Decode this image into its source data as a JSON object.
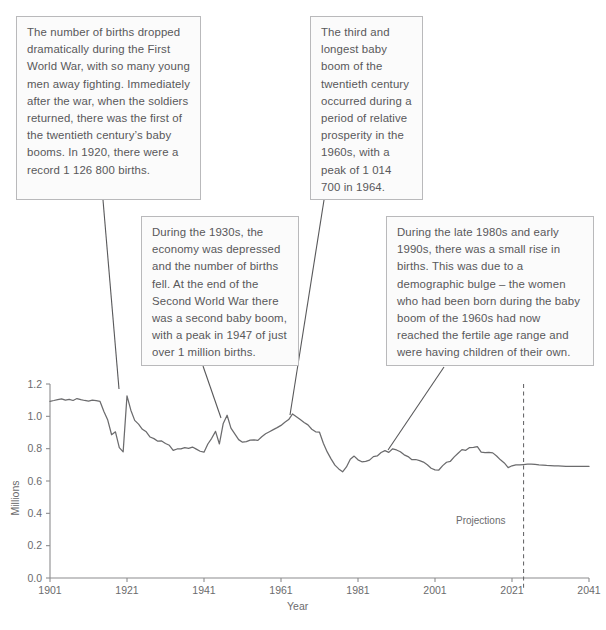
{
  "notes": [
    {
      "id": "note-wwi-birth-drop",
      "text": "The number of births dropped dramatically during the First World War, with so many young men away fighting. Immediately after the war, when the soldiers returned, there was the first of the twentieth century’s baby booms. In 1920, there were a record 1 126 800 births."
    },
    {
      "id": "note-1930s-depression",
      "text": "During the 1930s, the economy was depressed and the number of births fell. At the end of the Second World War there was a second baby boom, with a peak in 1947 of just over 1 million births."
    },
    {
      "id": "note-1960s-baby-boom",
      "text": "The third and longest baby boom of the twentieth century occurred during a period of relative prosperity in the 1960s, with a peak of 1 014 700 in 1964."
    },
    {
      "id": "note-1980s-1990s-rise",
      "text": "During the late 1980s and early 1990s, there was a small rise in births. This was due to a demographic bulge – the women who had been born during the baby boom of the 1960s had now reached the fertile age range and were having children of their own."
    }
  ],
  "chart_data": {
    "type": "line",
    "title": "",
    "xlabel": "Year",
    "ylabel": "Millions",
    "xlim": [
      1901,
      2041
    ],
    "ylim": [
      0.0,
      1.2
    ],
    "xticks": [
      "1901",
      "1921",
      "1941",
      "1961",
      "1981",
      "2001",
      "2021",
      "2041"
    ],
    "xtick_values": [
      1901,
      1921,
      1941,
      1961,
      1981,
      2001,
      2021,
      2041
    ],
    "yticks": [
      "0.0",
      "0.2",
      "0.4",
      "0.6",
      "0.8",
      "1.0",
      "1.2"
    ],
    "ytick_values": [
      0.0,
      0.2,
      0.4,
      0.6,
      0.8,
      1.0,
      1.2
    ],
    "grid": false,
    "legend": false,
    "line_color": "#6b6b6d",
    "projection_marker": {
      "label": "Projections",
      "year": 2024,
      "style": "dashed-vertical"
    },
    "series": [
      {
        "name": "Births",
        "units": "millions",
        "x": [
          1901,
          1902,
          1903,
          1904,
          1905,
          1906,
          1907,
          1908,
          1909,
          1910,
          1911,
          1912,
          1913,
          1914,
          1915,
          1916,
          1917,
          1918,
          1919,
          1920,
          1921,
          1922,
          1923,
          1924,
          1925,
          1926,
          1927,
          1928,
          1929,
          1930,
          1931,
          1932,
          1933,
          1934,
          1935,
          1936,
          1937,
          1938,
          1939,
          1940,
          1941,
          1942,
          1943,
          1944,
          1945,
          1946,
          1947,
          1948,
          1949,
          1950,
          1951,
          1952,
          1953,
          1954,
          1955,
          1956,
          1957,
          1958,
          1959,
          1960,
          1961,
          1962,
          1963,
          1964,
          1965,
          1966,
          1967,
          1968,
          1969,
          1970,
          1971,
          1972,
          1973,
          1974,
          1975,
          1976,
          1977,
          1978,
          1979,
          1980,
          1981,
          1982,
          1983,
          1984,
          1985,
          1986,
          1987,
          1988,
          1989,
          1990,
          1991,
          1992,
          1993,
          1994,
          1995,
          1996,
          1997,
          1998,
          1999,
          2000,
          2001,
          2002,
          2003,
          2004,
          2005,
          2006,
          2007,
          2008,
          2009,
          2010,
          2011,
          2012,
          2013,
          2014,
          2015,
          2016,
          2017,
          2018,
          2019,
          2020,
          2021,
          2022,
          2023,
          2024,
          2025,
          2026,
          2027,
          2028,
          2029,
          2030,
          2031,
          2032,
          2033,
          2034,
          2035,
          2036,
          2037,
          2038,
          2039,
          2040,
          2041
        ],
        "y": [
          1.093,
          1.098,
          1.104,
          1.108,
          1.1,
          1.105,
          1.098,
          1.11,
          1.103,
          1.098,
          1.094,
          1.1,
          1.097,
          1.092,
          1.03,
          0.977,
          0.886,
          0.904,
          0.806,
          0.78,
          1.127,
          1.038,
          0.975,
          0.952,
          0.92,
          0.904,
          0.872,
          0.862,
          0.846,
          0.848,
          0.832,
          0.821,
          0.789,
          0.798,
          0.799,
          0.806,
          0.802,
          0.81,
          0.797,
          0.784,
          0.778,
          0.829,
          0.864,
          0.907,
          0.829,
          0.956,
          1.007,
          0.927,
          0.891,
          0.856,
          0.84,
          0.844,
          0.853,
          0.854,
          0.851,
          0.874,
          0.892,
          0.905,
          0.918,
          0.93,
          0.944,
          0.963,
          0.98,
          1.015,
          0.998,
          0.98,
          0.962,
          0.947,
          0.92,
          0.904,
          0.902,
          0.834,
          0.78,
          0.737,
          0.698,
          0.675,
          0.657,
          0.687,
          0.735,
          0.754,
          0.731,
          0.719,
          0.721,
          0.729,
          0.751,
          0.755,
          0.776,
          0.788,
          0.777,
          0.799,
          0.792,
          0.781,
          0.762,
          0.751,
          0.732,
          0.733,
          0.726,
          0.717,
          0.7,
          0.679,
          0.669,
          0.668,
          0.695,
          0.716,
          0.722,
          0.749,
          0.772,
          0.794,
          0.79,
          0.807,
          0.808,
          0.813,
          0.778,
          0.776,
          0.777,
          0.774,
          0.755,
          0.731,
          0.712,
          0.683,
          0.694,
          0.7,
          0.7,
          0.702,
          0.704,
          0.705,
          0.703,
          0.7,
          0.698,
          0.696,
          0.695,
          0.694,
          0.693,
          0.692,
          0.691,
          0.69,
          0.69,
          0.69,
          0.69,
          0.69,
          0.69
        ]
      }
    ],
    "annotations": [
      {
        "note": "1920 record births",
        "year": 1920,
        "value": 1.1268
      },
      {
        "note": "1947 peak",
        "year": 1947,
        "value": 1.007
      },
      {
        "note": "1964 peak",
        "year": 1964,
        "value": 1.0147
      }
    ]
  }
}
